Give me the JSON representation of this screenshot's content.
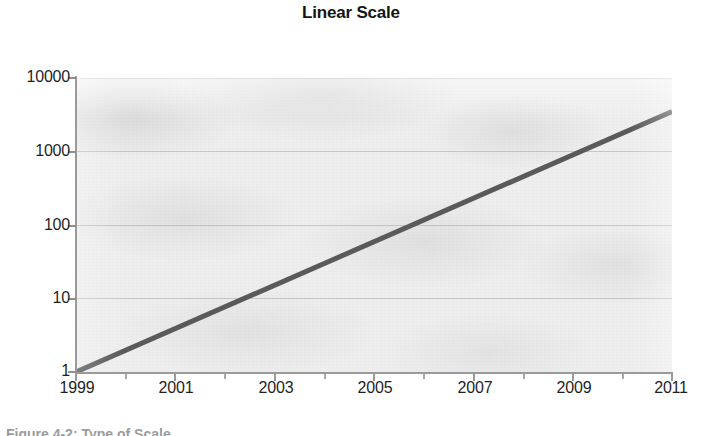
{
  "figure": {
    "caption": "Figure 4-2: Type of Scale",
    "caption_note": "cropped-at-bottom-edge"
  },
  "chart_data": {
    "type": "line",
    "title": "Linear Scale",
    "xlabel": "",
    "ylabel": "",
    "x": [
      1999,
      2000,
      2001,
      2002,
      2003,
      2004,
      2005,
      2006,
      2007,
      2008,
      2009,
      2010,
      2011
    ],
    "series": [
      {
        "name": "growth",
        "values": [
          1,
          2.2,
          4.8,
          10.5,
          23,
          50,
          110,
          240,
          530,
          1150,
          2500,
          5400,
          3500
        ],
        "color": "#5a5a5a",
        "line_width": 5
      }
    ],
    "x_tick_labels": [
      "1999",
      "2001",
      "2003",
      "2005",
      "2007",
      "2009",
      "2011"
    ],
    "x_tick_values": [
      1999,
      2001,
      2003,
      2005,
      2007,
      2009,
      2011
    ],
    "x_minor_tick_values": [
      2000,
      2002,
      2004,
      2006,
      2008,
      2010
    ],
    "y_tick_labels": [
      "10000",
      "1000",
      "100",
      "10",
      "1"
    ],
    "y_tick_values": [
      10000,
      1000,
      100,
      10,
      1
    ],
    "yscale": "log",
    "ylim": [
      1,
      10000
    ],
    "xlim": [
      1999,
      2011
    ],
    "grid": true,
    "legend": "none",
    "endpoints": {
      "start": {
        "x": 1999,
        "y": 1
      },
      "end": {
        "x": 2011,
        "y": 3500
      }
    },
    "colors": {
      "line": "#5a5a5a",
      "plot_background": "#eeeeee",
      "axis": "#9a9a9a",
      "text": "#1f1f1f",
      "page_background": "#ffffff"
    }
  }
}
